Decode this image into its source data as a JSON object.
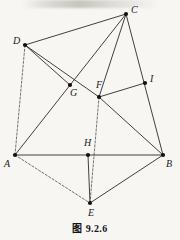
{
  "figure": {
    "caption": "图 9.2.6",
    "stroke_color": "#2b2b2b",
    "vertex_color": "#111111",
    "background_color": "#f7f6f3",
    "points": [
      {
        "id": "A",
        "label": "A",
        "x": 15,
        "y": 155,
        "label_dx": -11,
        "label_dy": 4
      },
      {
        "id": "B",
        "label": "B",
        "x": 163,
        "y": 155,
        "label_dx": 3,
        "label_dy": 4
      },
      {
        "id": "C",
        "label": "C",
        "x": 126,
        "y": 14,
        "label_dx": 5,
        "label_dy": -9
      },
      {
        "id": "D",
        "label": "D",
        "x": 25,
        "y": 45,
        "label_dx": -12,
        "label_dy": -9
      },
      {
        "id": "E",
        "label": "E",
        "x": 90,
        "y": 203,
        "label_dx": -2,
        "label_dy": 5
      },
      {
        "id": "F",
        "label": "F",
        "x": 99,
        "y": 97,
        "label_dx": -3,
        "label_dy": -17
      },
      {
        "id": "G",
        "label": "G",
        "x": 70,
        "y": 85,
        "label_dx": 0,
        "label_dy": 3
      },
      {
        "id": "H",
        "label": "H",
        "x": 88,
        "y": 155,
        "label_dx": -4,
        "label_dy": -17
      },
      {
        "id": "I",
        "label": "I",
        "x": 145,
        "y": 83,
        "label_dx": 5,
        "label_dy": -9
      }
    ],
    "segments": [
      {
        "from": "D",
        "to": "C",
        "style": "solid"
      },
      {
        "from": "C",
        "to": "B",
        "style": "solid"
      },
      {
        "from": "A",
        "to": "B",
        "style": "solid"
      },
      {
        "from": "A",
        "to": "D",
        "style": "dashed"
      },
      {
        "from": "A",
        "to": "E",
        "style": "dashed"
      },
      {
        "from": "E",
        "to": "B",
        "style": "solid"
      },
      {
        "from": "A",
        "to": "C",
        "style": "solid"
      },
      {
        "from": "D",
        "to": "G",
        "style": "solid"
      },
      {
        "from": "D",
        "to": "F",
        "style": "solid"
      },
      {
        "from": "C",
        "to": "F",
        "style": "solid"
      },
      {
        "from": "F",
        "to": "I",
        "style": "solid"
      },
      {
        "from": "F",
        "to": "B",
        "style": "solid"
      },
      {
        "from": "F",
        "to": "E",
        "style": "dashed"
      },
      {
        "from": "H",
        "to": "E",
        "style": "solid"
      }
    ]
  }
}
